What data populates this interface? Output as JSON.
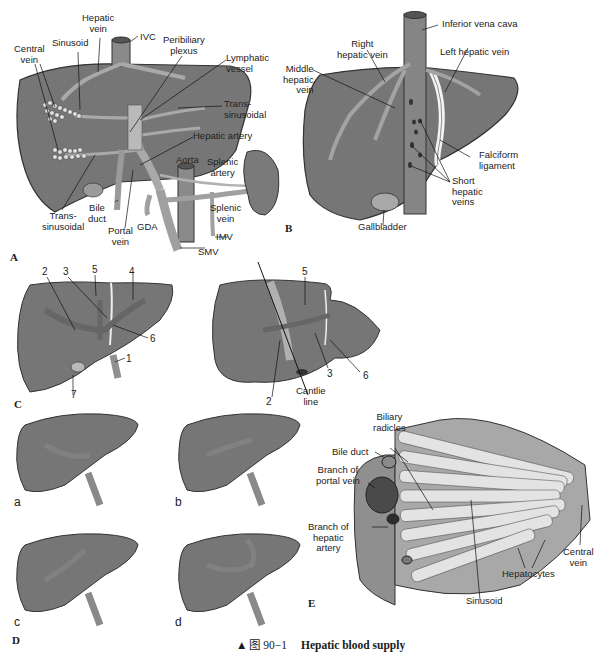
{
  "figure": {
    "caption_marker": "▲",
    "caption_number": "图 90−1",
    "caption_title": "Hepatic blood supply"
  },
  "colors": {
    "liver": "#767676",
    "liver_dark": "#5e5e5e",
    "vessel": "#a9a9a9",
    "vessel_light": "#c4c4c4",
    "cell": "#e2e2e2",
    "outline": "#333333"
  },
  "panels": {
    "A": {
      "letter": "A",
      "labels": {
        "hepatic_vein": "Hepatic\nvein",
        "ivc": "IVC",
        "sinusoid": "Sinusoid",
        "central_vein": "Central\nvein",
        "peribiliary_plexus": "Peribiliary\nplexus",
        "lymphatic_vessel": "Lymphatic\nvessel",
        "trans_sinusoidal_right": "Trans-\nsinusoidal",
        "hepatic_artery": "Hepatic artery",
        "aorta": "Aorta",
        "splenic_artery": "Splenic\nartery",
        "splenic_vein": "Splenic\nvein",
        "bile_duct": "Bile\nduct",
        "trans_sinusoidal_left": "Trans-\nsinusoidal",
        "portal_vein": "Portal\nvein",
        "gda": "GDA",
        "imv": "IMV",
        "smv": "SMV"
      }
    },
    "B": {
      "letter": "B",
      "labels": {
        "inferior_vena_cava": "Inferior vena cava",
        "right_hepatic_vein": "Right\nhepatic vein",
        "left_hepatic_vein": "Left hepatic vein",
        "middle_hepatic_vein": "Middle\nhepatic\nvein",
        "falciform_ligament": "Falciform\nligament",
        "short_hepatic_veins": "Short\nhepatic\nveins",
        "gallbladder": "Gallbladder"
      }
    },
    "C": {
      "letter": "C",
      "left_numbers": [
        "2",
        "3",
        "5",
        "4",
        "6",
        "1",
        "7"
      ],
      "right_numbers": [
        "5",
        "3",
        "6",
        "2"
      ],
      "cantlie_line": "Cantlie\nline"
    },
    "D": {
      "letter": "D",
      "variants": [
        "a",
        "b",
        "c",
        "d"
      ]
    },
    "E": {
      "letter": "E",
      "labels": {
        "biliary_radicles": "Biliary\nradicles",
        "bile_duct": "Bile duct",
        "branch_portal_vein": "Branch of\nportal vein",
        "branch_hepatic_artery": "Branch of\nhepatic\nartery",
        "central_vein": "Central\nvein",
        "hepatocytes": "Hepatocytes",
        "sinusoid": "Sinusoid"
      }
    }
  }
}
